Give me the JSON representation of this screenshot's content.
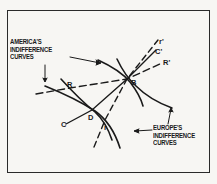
{
  "figure": {
    "labels": {
      "america": [
        "AMERICA'S",
        "INDIFFERENCE",
        "CURVES"
      ],
      "europe": [
        "EUROPE'S",
        "INDIFFERENCE",
        "CURVES"
      ]
    },
    "points": {
      "B": "B",
      "D": "D",
      "R": "R",
      "r": "r",
      "C": "C"
    },
    "line_ends": {
      "r_prime": "r'",
      "c_prime": "C'",
      "r_cap_prime": "R'"
    },
    "colors": {
      "ink": "#1a1a1a",
      "paper": "#f7f6f3"
    }
  }
}
